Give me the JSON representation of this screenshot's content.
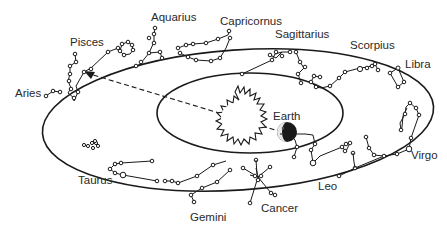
{
  "diagram": {
    "type": "zodiac-ecliptic",
    "center_labels": {
      "earth": "Earth"
    },
    "constellations": [
      {
        "name": "Aries",
        "x": 5,
        "y": 88
      },
      {
        "name": "Pisces",
        "x": 70,
        "y": 37
      },
      {
        "name": "Aquarius",
        "x": 150,
        "y": 11
      },
      {
        "name": "Capricornus",
        "x": 222,
        "y": 16
      },
      {
        "name": "Sagittarius",
        "x": 275,
        "y": 30
      },
      {
        "name": "Scorpius",
        "x": 350,
        "y": 40
      },
      {
        "name": "Libra",
        "x": 405,
        "y": 59
      },
      {
        "name": "Virgo",
        "x": 410,
        "y": 150
      },
      {
        "name": "Leo",
        "x": 318,
        "y": 181
      },
      {
        "name": "Cancer",
        "x": 261,
        "y": 205
      },
      {
        "name": "Gemini",
        "x": 190,
        "y": 213
      },
      {
        "name": "Taurus",
        "x": 78,
        "y": 176
      }
    ],
    "colors": {
      "line": "#1a1a1a",
      "text": "#2a2a2a",
      "background": "#ffffff"
    }
  }
}
